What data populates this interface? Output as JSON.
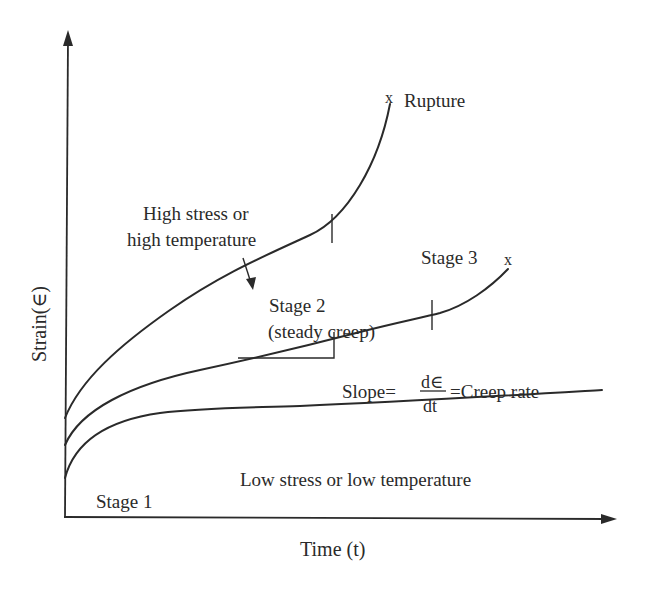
{
  "diagram": {
    "axes": {
      "x_label": "Time (t)",
      "y_label": "Strain(∈)"
    },
    "curves": [
      {
        "name": "high-stress-curve",
        "label_line1": "High stress or",
        "label_line2": "high temperature",
        "end_marker": "x",
        "end_label": "Rupture"
      },
      {
        "name": "medium-curve",
        "stage2_line1": "Stage 2",
        "stage2_line2": "(steady creep)",
        "stage3_label": "Stage 3",
        "end_marker": "x"
      },
      {
        "name": "low-stress-curve",
        "label": "Low stress or low temperature",
        "stage1_label": "Stage 1"
      }
    ],
    "slope_annotation": {
      "prefix": "Slope",
      "equals1": "=",
      "numerator": "d∈",
      "denominator": "dt",
      "equals2": "=",
      "suffix": "Creep rate"
    },
    "colors": {
      "ink": "#2a2a2a",
      "background": "#ffffff"
    }
  }
}
